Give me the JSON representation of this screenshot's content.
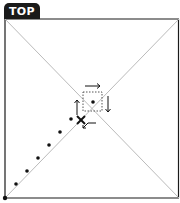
{
  "view": {
    "label": "TOP"
  },
  "diagram": {
    "frame": {
      "x": 5,
      "y": 19,
      "w": 174,
      "h": 179
    },
    "colors": {
      "frame": "#1a1a1a",
      "diagonal": "#bbbbbb",
      "marker": "#111111"
    },
    "dots": [
      [
        16,
        184
      ],
      [
        28,
        170
      ],
      [
        40,
        156
      ],
      [
        52,
        142
      ],
      [
        63,
        128
      ],
      [
        74,
        115
      ]
    ],
    "origin_dot": [
      5,
      198
    ],
    "selection_box": {
      "x": 83,
      "y": 92,
      "w": 19,
      "h": 19
    },
    "center_dot": [
      93,
      102
    ],
    "x_marker": [
      81,
      120
    ]
  }
}
